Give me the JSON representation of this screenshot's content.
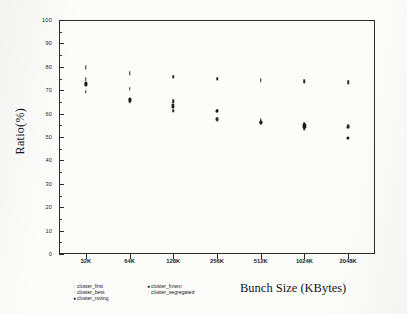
{
  "chart_data": {
    "type": "scatter",
    "title": "",
    "xlabel": "Bunch Size (KBytes)",
    "ylabel": "Ratio(%)",
    "categories": [
      "32K",
      "64K",
      "128K",
      "256K",
      "512K",
      "1024K",
      "2048K"
    ],
    "ylim": [
      0,
      100
    ],
    "yticks": [
      0,
      10,
      20,
      30,
      40,
      50,
      60,
      70,
      80,
      90,
      100
    ],
    "ytick_labels": [
      "0",
      "10",
      "20",
      "30",
      "40",
      "50",
      "60",
      "70",
      "80",
      "90",
      "100"
    ],
    "grid": false,
    "legend_position": "below-axis-left",
    "series": [
      {
        "name": "cluster_first",
        "marker": "tick",
        "values": [
          79.8,
          77.2,
          75.6,
          75.0,
          74.3,
          73.8,
          73.3
        ]
      },
      {
        "name": "cluster_best",
        "marker": "tick",
        "values": [
          74.6,
          70.5,
          65.2,
          61.3,
          57.2,
          55.6,
          54.8
        ]
      },
      {
        "name": "cluster_roving",
        "marker": "dot",
        "values": [
          72.9,
          66.3,
          63.6,
          61.1,
          56.6,
          55.0,
          54.4
        ]
      },
      {
        "name": "cluster_fmem",
        "marker": "dot",
        "values": [
          72.4,
          65.6,
          63.0,
          57.6,
          56.2,
          54.2,
          49.6
        ]
      },
      {
        "name": "cluster_segregated",
        "marker": "tick",
        "values": [
          69.3,
          65.0,
          61.2,
          57.6,
          56.0,
          53.6,
          54.4
        ]
      }
    ]
  },
  "axes": {
    "y_title": "Ratio(%)",
    "x_title": "Bunch Size (KBytes)",
    "y_labels": [
      "100",
      "90",
      "80",
      "70",
      "60",
      "50",
      "40",
      "30",
      "20",
      "10",
      "0"
    ],
    "x_labels": [
      "32K",
      "64K",
      "128K",
      "256K",
      "512K",
      "1024K",
      "2048K"
    ]
  },
  "legend": {
    "column_left": [
      {
        "marker": ":",
        "label": "cluster_first"
      },
      {
        "marker": ":",
        "label": "cluster_best"
      },
      {
        "marker": "●",
        "label": "cluster_roving"
      }
    ],
    "column_right": [
      {
        "marker": "●",
        "label": "cluster_fmem"
      },
      {
        "marker": ":",
        "label": "cluster_segregated"
      }
    ]
  },
  "colors": {
    "ink": "#1a1a1a",
    "axis": "#2b2b2b",
    "paper": "#fcfcfb"
  }
}
